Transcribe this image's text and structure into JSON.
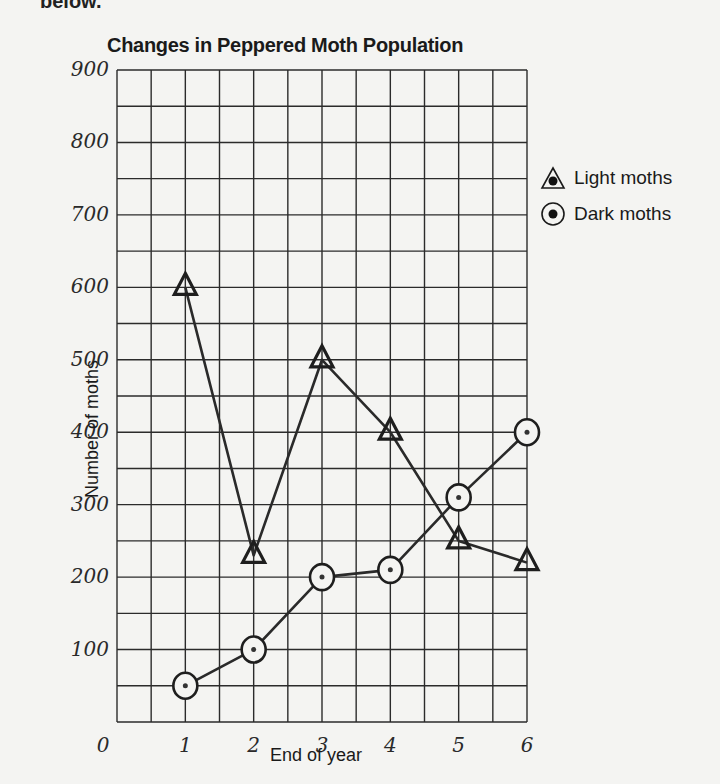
{
  "header": {
    "cut_text": "below."
  },
  "chart_data": {
    "type": "line",
    "title": "Changes in Peppered Moth Population",
    "xlabel": "End of year",
    "ylabel": "Number of moths",
    "x": [
      1,
      2,
      3,
      4,
      5,
      6
    ],
    "x_tick_labels": [
      "0",
      "1",
      "2",
      "3",
      "4",
      "5",
      "6"
    ],
    "y_tick_labels": [
      "100",
      "200",
      "300",
      "400",
      "500",
      "600",
      "700",
      "800",
      "900"
    ],
    "ylim": [
      0,
      900
    ],
    "xlim": [
      0,
      6
    ],
    "grid": true,
    "grid_columns": 12,
    "grid_rows": 18,
    "legend_position": "right",
    "series": [
      {
        "name": "Light moths",
        "marker": "triangle",
        "values": [
          600,
          230,
          500,
          400,
          250,
          220
        ]
      },
      {
        "name": "Dark moths",
        "marker": "circle",
        "values": [
          50,
          100,
          200,
          210,
          310,
          400
        ]
      }
    ]
  },
  "legend": {
    "items": [
      {
        "label": "Light moths",
        "icon": "triangle-dot-icon"
      },
      {
        "label": "Dark moths",
        "icon": "circle-dot-icon"
      }
    ]
  }
}
